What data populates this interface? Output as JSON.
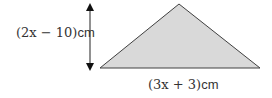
{
  "diagram": {
    "shape": "triangle",
    "fill_color": "#d9d9d9",
    "stroke_color": "#404040",
    "height_label": {
      "expr": "(2x − 10)",
      "unit": "cm"
    },
    "base_label": {
      "expr": "(3x + 3)",
      "unit": "cm"
    },
    "arrow": "double-headed vertical arrow indicating height"
  }
}
